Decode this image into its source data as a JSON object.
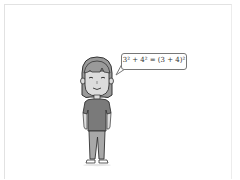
{
  "scene": {
    "description": "Cartoon girl with speech bubble",
    "speech_bubble": {
      "text": "3² + 4² = (3 + 4)²"
    },
    "colors": {
      "hair": "#9a9a9a",
      "skin": "#dcdcdc",
      "shirt": "#7a7a7a",
      "pants": "#a8a8a8",
      "outline": "#333333",
      "frame": "#e2e2e2"
    }
  }
}
